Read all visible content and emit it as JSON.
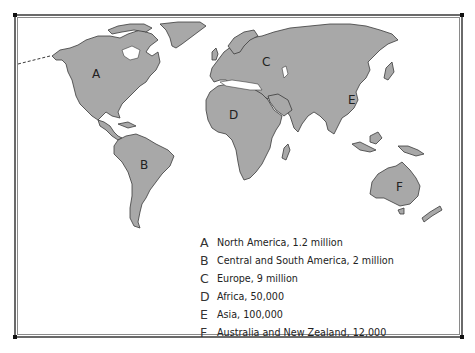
{
  "map": {
    "land_color": "#a8a8a8",
    "coast_color": "#3a3a3a",
    "water_color": "#ffffff",
    "regions": [
      {
        "letter": "A",
        "name": "North America",
        "label_x": 92,
        "label_y": 78
      },
      {
        "letter": "B",
        "name": "Central and South America",
        "label_x": 140,
        "label_y": 169
      },
      {
        "letter": "C",
        "name": "Europe",
        "label_x": 262,
        "label_y": 66
      },
      {
        "letter": "D",
        "name": "Africa",
        "label_x": 229,
        "label_y": 119
      },
      {
        "letter": "E",
        "name": "Asia",
        "label_x": 348,
        "label_y": 104
      },
      {
        "letter": "F",
        "name": "Australia and New Zealand",
        "label_x": 396,
        "label_y": 191
      }
    ]
  },
  "legend": {
    "items": [
      {
        "letter": "A",
        "text": "North America, 1.2 million"
      },
      {
        "letter": "B",
        "text": "Central and South America, 2 million"
      },
      {
        "letter": "C",
        "text": "Europe, 9 million"
      },
      {
        "letter": "D",
        "text": "Africa, 50,000"
      },
      {
        "letter": "E",
        "text": "Asia, 100,000"
      },
      {
        "letter": "F",
        "text": "Australia and New Zealand, 12,000"
      }
    ]
  }
}
